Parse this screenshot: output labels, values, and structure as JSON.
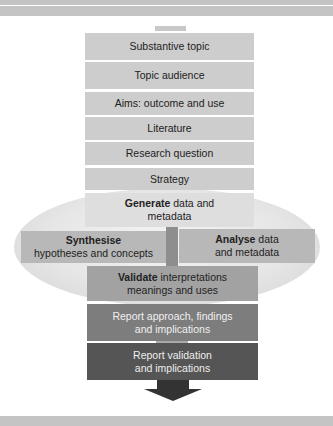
{
  "diagram": {
    "type": "vertical process flow",
    "steps": [
      {
        "label": "Substantive topic"
      },
      {
        "label": "Topic audience"
      },
      {
        "label": "Aims: outcome and use"
      },
      {
        "label": "Literature"
      },
      {
        "label": "Research question"
      },
      {
        "label": "Strategy"
      },
      {
        "bold": "Generate",
        "rest_line1": " data and",
        "line2": "metadata"
      },
      {
        "bold": "Synthesise",
        "line2": "hypotheses and concepts"
      },
      {
        "bold": "Analyse",
        "rest_line1": " data",
        "line2": "and  metadata"
      },
      {
        "bold": "Validate",
        "rest_line1": " interpretations",
        "line2": "meanings and uses"
      },
      {
        "line1": "Report approach, findings",
        "line2": "and implications"
      },
      {
        "line1": "Report validation",
        "line2": "and implications"
      }
    ],
    "colors": {
      "light_box": "#cdcdcd",
      "mid_box": "#9a9a9a",
      "report_approach": "#7d7d7d",
      "report_validation": "#555555",
      "arrow": "#333333",
      "bars": "#c4c4c4"
    }
  }
}
